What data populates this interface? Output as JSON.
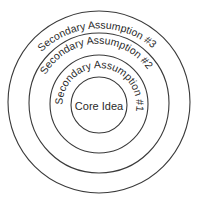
{
  "diagram": {
    "type": "concentric-circles",
    "rings": [
      {
        "label": "Core Idea"
      },
      {
        "label": "Secondary Assumption #1"
      },
      {
        "label": "Secondary Assumption #2"
      },
      {
        "label": "Secondary Assumption #3"
      }
    ],
    "colors": {
      "stroke": "#3a3a3a",
      "text": "#2a2a2a",
      "background": "#ffffff"
    }
  }
}
